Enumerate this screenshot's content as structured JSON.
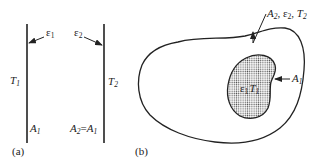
{
  "panel_a": {
    "label": "(a)",
    "surface_1": {
      "temperature": "T",
      "temperature_sub": "1",
      "emissivity": "ε",
      "emissivity_sub": "1",
      "area": "A",
      "area_sub": "1"
    },
    "surface_2": {
      "temperature": "T",
      "temperature_sub": "2",
      "emissivity": "ε",
      "emissivity_sub": "2",
      "area_lhs": "A",
      "area_lhs_sub": "2",
      "area_eq": "=",
      "area_rhs": "A",
      "area_rhs_sub": "1"
    }
  },
  "panel_b": {
    "label": "(b)",
    "outer": {
      "area": "A",
      "area_sub": "2",
      "sep1": ", ",
      "emissivity": "ε",
      "emissivity_sub": "2",
      "sep2": ", ",
      "temperature": "T",
      "temperature_sub": "2"
    },
    "inner": {
      "emissivity": "ε",
      "emissivity_sub": "1",
      "temperature": "T",
      "temperature_sub": "1",
      "area": "A",
      "area_sub": "1"
    }
  },
  "colors": {
    "stroke": "#222222",
    "background": "#ffffff",
    "dots": "#555555"
  }
}
